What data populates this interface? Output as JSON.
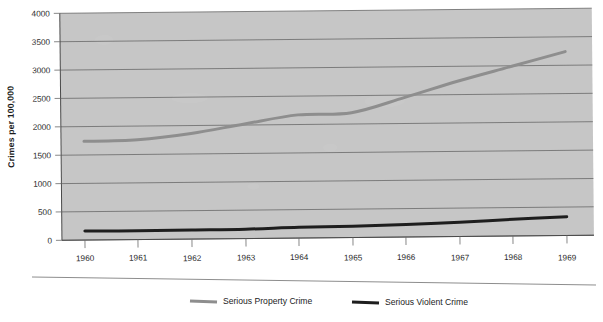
{
  "chart_data": {
    "type": "line",
    "title": "",
    "subtitle": "",
    "xlabel": "",
    "ylabel": "Crimes per 100,000",
    "x": [
      1960,
      1961,
      1962,
      1963,
      1964,
      1965,
      1966,
      1967,
      1968,
      1969
    ],
    "categories": [
      "1960",
      "1961",
      "1962",
      "1963",
      "1964",
      "1965",
      "1966",
      "1967",
      "1968",
      "1969"
    ],
    "xtick_labels": [
      "1960",
      "1961",
      "1962",
      "1963",
      "1964",
      "1965",
      "1966",
      "1967",
      "1968",
      "1969"
    ],
    "ytick_labels": [
      "0",
      "500",
      "1000",
      "1500",
      "2000",
      "2500",
      "3000",
      "3500",
      "4000"
    ],
    "yticks": [
      0,
      500,
      1000,
      1500,
      2000,
      2500,
      3000,
      3500,
      4000
    ],
    "ylim": [
      0,
      4000
    ],
    "xlim": [
      1960,
      1969
    ],
    "grid": "horizontal",
    "legend_position": "bottom",
    "plot_background": "#c6c6c6",
    "series": [
      {
        "name": "Serious Property Crime",
        "color": "#8e8e8e",
        "width": 3.0,
        "values": [
          1740,
          1760,
          1860,
          2020,
          2170,
          2200,
          2460,
          2740,
          2990,
          3240
        ]
      },
      {
        "name": "Serious Violent Crime",
        "color": "#1e1e1e",
        "width": 3.0,
        "values": [
          160,
          155,
          160,
          165,
          190,
          200,
          220,
          250,
          295,
          330
        ]
      }
    ]
  },
  "legend": {
    "items": [
      {
        "label": "Serious Property Crime",
        "color": "#8e8e8e"
      },
      {
        "label": "Serious Violent Crime",
        "color": "#1e1e1e"
      }
    ]
  },
  "axes": {
    "y_title": "Crimes per 100,000"
  }
}
